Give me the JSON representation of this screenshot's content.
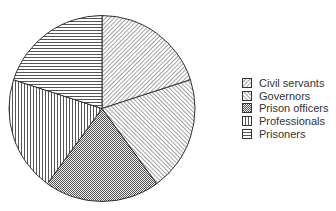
{
  "chart_data": {
    "type": "pie",
    "title": "",
    "categories": [
      "Civil servants",
      "Governors",
      "Prison officers",
      "Professionals",
      "Prisoners"
    ],
    "values": [
      20,
      20,
      20,
      20,
      20
    ],
    "patterns": [
      "diag-back",
      "diag-fwd",
      "crosshatch",
      "vertical",
      "horizontal"
    ],
    "start_angle_deg": 0,
    "direction": "clockwise",
    "legend_position": "right",
    "colors": {
      "stroke": "#333333",
      "fill": "#ffffff"
    }
  },
  "legend": {
    "items": [
      {
        "label": "Civil servants"
      },
      {
        "label": "Governors"
      },
      {
        "label": "Prison officers"
      },
      {
        "label": "Professionals"
      },
      {
        "label": "Prisoners"
      }
    ]
  }
}
